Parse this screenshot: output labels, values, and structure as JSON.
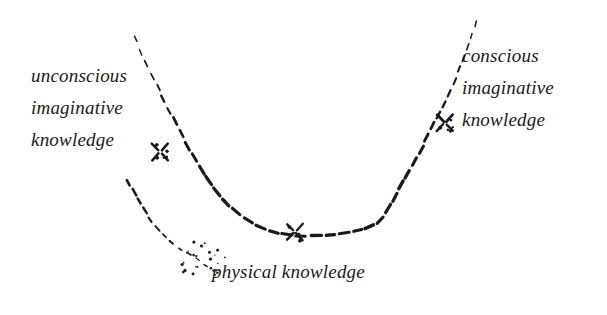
{
  "figure": {
    "background_color": "#ffffff",
    "ink_color": "#1a1a1a",
    "style": "hand-drawn dashed curve, italic serif labels"
  },
  "labels": {
    "left": {
      "line1": "unconscious",
      "line2": "imaginative",
      "line3": "knowledge"
    },
    "right": {
      "line1": "conscious",
      "line2": "imaginative",
      "line3": "knowledge"
    },
    "bottom": {
      "line1": "physical knowledge"
    }
  },
  "markers": [
    {
      "name": "marker-left-x",
      "x": 160,
      "y": 152
    },
    {
      "name": "marker-center-x",
      "x": 295,
      "y": 232
    },
    {
      "name": "marker-right-x",
      "x": 445,
      "y": 123
    }
  ],
  "chart_data": {
    "type": "line",
    "title": "",
    "xlabel": "",
    "ylabel": "",
    "grid": false,
    "legend": false,
    "xlim": [
      0,
      607
    ],
    "ylim": [
      315,
      0
    ],
    "series": [
      {
        "name": "main-well-curve",
        "stroke": "dashed",
        "points": [
          [
            133,
            35
          ],
          [
            139,
            48
          ],
          [
            145,
            62
          ],
          [
            152,
            76
          ],
          [
            159,
            90
          ],
          [
            166,
            104
          ],
          [
            173,
            117
          ],
          [
            180,
            131
          ],
          [
            188,
            146
          ],
          [
            196,
            160
          ],
          [
            205,
            175
          ],
          [
            214,
            188
          ],
          [
            224,
            200
          ],
          [
            235,
            211
          ],
          [
            247,
            220
          ],
          [
            260,
            227
          ],
          [
            274,
            232
          ],
          [
            288,
            235
          ],
          [
            303,
            236
          ],
          [
            318,
            236
          ],
          [
            333,
            235
          ],
          [
            348,
            233
          ],
          [
            362,
            230
          ],
          [
            374,
            225
          ],
          [
            383,
            217
          ],
          [
            392,
            203
          ],
          [
            400,
            188
          ],
          [
            409,
            172
          ],
          [
            418,
            155
          ],
          [
            427,
            138
          ],
          [
            436,
            120
          ],
          [
            445,
            102
          ],
          [
            453,
            84
          ],
          [
            461,
            65
          ],
          [
            468,
            47
          ],
          [
            473,
            32
          ],
          [
            476,
            20
          ]
        ]
      },
      {
        "name": "lower-left-branch",
        "stroke": "dashed-fading",
        "points": [
          [
            126,
            178
          ],
          [
            133,
            191
          ],
          [
            140,
            203
          ],
          [
            147,
            214
          ],
          [
            154,
            224
          ],
          [
            162,
            233
          ],
          [
            170,
            241
          ],
          [
            179,
            248
          ],
          [
            188,
            254
          ],
          [
            196,
            259
          ],
          [
            203,
            264
          ],
          [
            209,
            268
          ],
          [
            214,
            271
          ]
        ]
      }
    ],
    "annotations": [
      {
        "text": "unconscious imaginative knowledge",
        "at": [
          33,
          80
        ]
      },
      {
        "text": "conscious imaginative knowledge",
        "at": [
          463,
          60
        ]
      },
      {
        "text": "physical knowledge",
        "at": [
          213,
          278
        ]
      }
    ]
  }
}
